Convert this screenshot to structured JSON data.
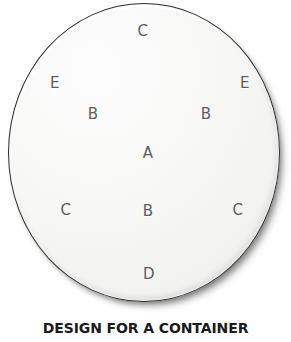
{
  "figure": {
    "caption": "DESIGN FOR A CONTAINER",
    "plate": {
      "shape": "circle",
      "fill_color": "#f4f4f3",
      "outline_color": "#2e2e2e",
      "background_color": "#ffffff",
      "label_color": "#5d5d5d",
      "caption_color": "#1b1b1b"
    },
    "markers": [
      {
        "label": "C",
        "x": 143,
        "y": 31
      },
      {
        "label": "E",
        "x": 55,
        "y": 83
      },
      {
        "label": "E",
        "x": 245,
        "y": 83
      },
      {
        "label": "B",
        "x": 93,
        "y": 114
      },
      {
        "label": "B",
        "x": 206,
        "y": 114
      },
      {
        "label": "A",
        "x": 148,
        "y": 153
      },
      {
        "label": "C",
        "x": 66,
        "y": 210
      },
      {
        "label": "B",
        "x": 148,
        "y": 211
      },
      {
        "label": "C",
        "x": 238,
        "y": 210
      },
      {
        "label": "D",
        "x": 149,
        "y": 274
      }
    ]
  }
}
